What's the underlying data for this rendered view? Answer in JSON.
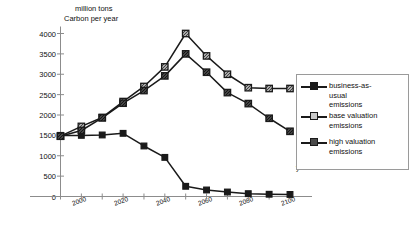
{
  "chart_data": {
    "type": "line",
    "title": "",
    "xlabel": "year",
    "ylabel": "million tons Carbon per year",
    "ylabel_line1": "million tons",
    "ylabel_line2": "Carbon per year",
    "xlim": [
      1990,
      2100
    ],
    "ylim": [
      0,
      4000
    ],
    "grid": false,
    "legend_position": "right",
    "yticks": [
      0,
      500,
      1000,
      1500,
      2000,
      2500,
      3000,
      3500,
      4000
    ],
    "ytick_labels": [
      "0",
      "500",
      "1000",
      "1500",
      "2000",
      "2500",
      "3000",
      "3500",
      "4000"
    ],
    "xticks": [
      2000,
      2020,
      2040,
      2060,
      2080,
      2100
    ],
    "xtick_labels": [
      "2000",
      "2020",
      "2040",
      "2060",
      "2080",
      "2100"
    ],
    "xminorticks": [
      1990,
      2010,
      2030,
      2050,
      2070,
      2090
    ],
    "x": [
      1990,
      2000,
      2010,
      2020,
      2030,
      2040,
      2050,
      2060,
      2070,
      2080,
      2090,
      2100
    ],
    "series": [
      {
        "name": "business-as-usual emissions",
        "marker": "filled-square",
        "values": [
          1500,
          1500,
          1510,
          1550,
          1240,
          960,
          250,
          160,
          110,
          70,
          55,
          50
        ]
      },
      {
        "name": "base valuation emissions",
        "marker": "light-hatched-square",
        "values": [
          1480,
          1720,
          1940,
          2330,
          2700,
          3180,
          4000,
          3450,
          3000,
          2670,
          2650,
          2650
        ]
      },
      {
        "name": "high valuation emissions",
        "marker": "dark-hatched-square",
        "values": [
          1480,
          1620,
          1930,
          2290,
          2600,
          2960,
          3500,
          3050,
          2550,
          2280,
          1920,
          1600
        ]
      }
    ]
  },
  "legend": {
    "entries": [
      {
        "label": "business-as-\nusual\nemissions",
        "marker": "filled-square"
      },
      {
        "label": "base valuation\nemissions",
        "marker": "light-hatched-square"
      },
      {
        "label": "high valuation\nemissions",
        "marker": "dark-hatched-square"
      }
    ]
  },
  "colors": {
    "line": "#1a1a1a",
    "axis": "#8c8c8c",
    "legend_border": "#9a9a9a",
    "marker_light_fill": "#c9c9c9",
    "marker_dark_fill": "#4a4a4a",
    "marker_solid_fill": "#1a1a1a",
    "background": "#ffffff"
  }
}
